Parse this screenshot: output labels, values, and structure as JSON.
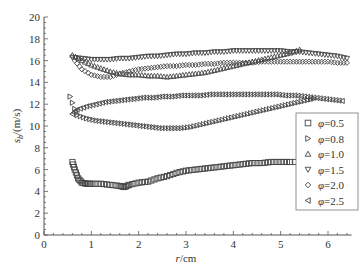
{
  "chart_data": {
    "type": "scatter",
    "title": "",
    "xlabel": "r/cm",
    "ylabel": "s_b/(m/s)",
    "xlim": [
      0,
      6.5
    ],
    "ylim": [
      0,
      20
    ],
    "x_ticks": [
      0,
      1,
      2,
      3,
      4,
      5,
      6
    ],
    "y_ticks": [
      0,
      2,
      4,
      6,
      8,
      10,
      12,
      14,
      16,
      18,
      20
    ],
    "grid": false,
    "legend_position": "right-middle",
    "series": [
      {
        "name": "φ=0.5",
        "marker": "square",
        "x": [
          0.6,
          0.65,
          0.72,
          0.8,
          0.9,
          1.0,
          1.2,
          1.4,
          1.6,
          1.7,
          1.8,
          2.0,
          2.2,
          2.4,
          2.6,
          2.8,
          3.0,
          3.2,
          3.4,
          3.6,
          3.8,
          4.0,
          4.2,
          4.4,
          4.6,
          4.8,
          5.0,
          5.2,
          5.5
        ],
        "values": [
          6.7,
          6.0,
          5.2,
          4.8,
          4.7,
          4.7,
          4.7,
          4.6,
          4.5,
          4.4,
          4.6,
          4.8,
          4.9,
          5.2,
          5.4,
          5.7,
          5.9,
          6.0,
          6.1,
          6.2,
          6.3,
          6.4,
          6.5,
          6.6,
          6.6,
          6.7,
          6.7,
          6.7,
          6.7
        ]
      },
      {
        "name": "φ=0.8",
        "marker": "triangle-right",
        "x": [
          0.55,
          0.7,
          0.9,
          1.1,
          1.3,
          1.5,
          1.7,
          1.9,
          2.1,
          2.3,
          2.5,
          2.7,
          2.9,
          3.1,
          3.3,
          3.5,
          3.7,
          3.9,
          4.1,
          4.3,
          4.5,
          4.7,
          4.9,
          5.1,
          5.3,
          5.5,
          5.7
        ],
        "values": [
          12.7,
          11.0,
          10.7,
          10.5,
          10.4,
          10.3,
          10.2,
          10.1,
          10.0,
          9.9,
          9.8,
          9.8,
          9.8,
          9.9,
          10.1,
          10.3,
          10.5,
          10.7,
          10.9,
          11.1,
          11.3,
          11.5,
          11.7,
          11.9,
          12.1,
          12.3,
          12.5
        ]
      },
      {
        "name": "φ=1.0",
        "marker": "triangle-up",
        "x": [
          0.6,
          0.8,
          1.0,
          1.2,
          1.4,
          1.6,
          1.8,
          2.0,
          2.2,
          2.4,
          2.6,
          2.8,
          3.0,
          3.2,
          3.4,
          3.6,
          3.8,
          4.0,
          4.2,
          4.4,
          4.6,
          4.8,
          5.0,
          5.2,
          5.4
        ],
        "values": [
          16.5,
          16.0,
          15.6,
          15.3,
          15.0,
          14.8,
          14.7,
          14.7,
          14.6,
          14.6,
          14.5,
          14.6,
          14.7,
          14.8,
          14.9,
          15.1,
          15.3,
          15.5,
          15.7,
          15.9,
          16.1,
          16.3,
          16.5,
          16.7,
          17.0
        ]
      },
      {
        "name": "φ=1.5",
        "marker": "triangle-down",
        "x": [
          0.6,
          0.8,
          1.0,
          1.2,
          1.4,
          1.6,
          1.8,
          2.0,
          2.2,
          2.4,
          2.6,
          2.8,
          3.0,
          3.2,
          3.4,
          3.6,
          3.8,
          4.0,
          4.2,
          4.4,
          4.6,
          4.8,
          5.0,
          5.2,
          5.4,
          5.6,
          5.8,
          6.0,
          6.2,
          6.4
        ],
        "values": [
          16.3,
          16.2,
          16.1,
          16.1,
          16.1,
          16.2,
          16.2,
          16.3,
          16.4,
          16.4,
          16.5,
          16.6,
          16.6,
          16.7,
          16.7,
          16.8,
          16.8,
          16.9,
          16.9,
          16.9,
          16.9,
          16.9,
          16.9,
          16.8,
          16.8,
          16.7,
          16.6,
          16.5,
          16.4,
          16.2
        ]
      },
      {
        "name": "φ=2.0",
        "marker": "diamond",
        "x": [
          0.65,
          0.8,
          1.0,
          1.2,
          1.4,
          1.6,
          1.8,
          2.0,
          2.2,
          2.4,
          2.6,
          2.8,
          3.0,
          3.2,
          3.4,
          3.6,
          3.8,
          4.0,
          4.2,
          4.4,
          4.6,
          4.8,
          5.0,
          5.2,
          5.4,
          5.6,
          5.8,
          6.0,
          6.2,
          6.4
        ],
        "values": [
          16.0,
          15.2,
          14.7,
          14.5,
          14.5,
          14.8,
          15.0,
          15.2,
          15.3,
          15.4,
          15.5,
          15.5,
          15.6,
          15.6,
          15.7,
          15.7,
          15.8,
          15.8,
          15.8,
          15.8,
          15.9,
          15.9,
          15.9,
          15.9,
          15.9,
          15.9,
          15.9,
          15.9,
          15.8,
          15.8
        ]
      },
      {
        "name": "φ=2.5",
        "marker": "triangle-left",
        "x": [
          0.6,
          0.7,
          0.9,
          1.1,
          1.3,
          1.5,
          1.7,
          1.9,
          2.1,
          2.3,
          2.5,
          2.7,
          2.9,
          3.1,
          3.3,
          3.5,
          3.7,
          3.9,
          4.1,
          4.3,
          4.5,
          4.7,
          4.9,
          5.1,
          5.3,
          5.5,
          5.7,
          5.9,
          6.1,
          6.3
        ],
        "values": [
          11.1,
          11.5,
          11.8,
          12.0,
          12.2,
          12.3,
          12.4,
          12.5,
          12.6,
          12.6,
          12.7,
          12.7,
          12.8,
          12.8,
          12.8,
          12.9,
          12.9,
          12.9,
          12.9,
          12.9,
          12.9,
          12.9,
          12.9,
          12.8,
          12.8,
          12.7,
          12.6,
          12.5,
          12.4,
          12.3
        ]
      }
    ]
  },
  "axes": {
    "xlabel_italic": "r",
    "xlabel_unit": "/cm",
    "ylabel_main": "s",
    "ylabel_sub": "b",
    "ylabel_unit": "/(m/s)"
  },
  "legend": {
    "items": [
      {
        "symbol": "φ",
        "value": "=0.5",
        "marker": "square"
      },
      {
        "symbol": "φ",
        "value": "=0.8",
        "marker": "triangle-right"
      },
      {
        "symbol": "φ",
        "value": "=1.0",
        "marker": "triangle-up"
      },
      {
        "symbol": "φ",
        "value": "=1.5",
        "marker": "triangle-down"
      },
      {
        "symbol": "φ",
        "value": "=2.0",
        "marker": "diamond"
      },
      {
        "symbol": "φ",
        "value": "=2.5",
        "marker": "triangle-left"
      }
    ]
  },
  "colors": {
    "axis": "#555555",
    "marker_stroke": "#444444",
    "text": "#333333",
    "background": "#ffffff"
  }
}
